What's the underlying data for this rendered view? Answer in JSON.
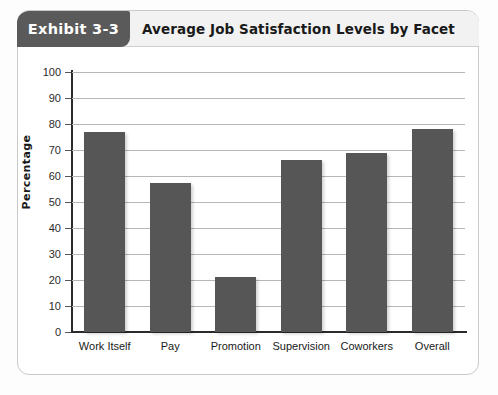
{
  "header": {
    "exhibit_label": "Exhibit 3-3",
    "title": "Average Job Satisfaction Levels by Facet"
  },
  "colors": {
    "bar_fill": "#565656",
    "tab_background": "#5a5a5a",
    "header_band": "#f2f2f2",
    "gridline": "#b7b7b7",
    "axis": "#2b2b2b",
    "panel_border": "#c9c9c9"
  },
  "chart_data": {
    "type": "bar",
    "title": "Average Job Satisfaction Levels by Facet",
    "xlabel": "",
    "ylabel": "Percentage",
    "ylim": [
      0,
      100
    ],
    "ytick_step": 10,
    "yticks": [
      100,
      90,
      80,
      70,
      60,
      50,
      40,
      30,
      20,
      10,
      0
    ],
    "ytick_labels": [
      "100",
      "90",
      "80",
      "70",
      "60",
      "50",
      "40",
      "30",
      "20",
      "10",
      "0"
    ],
    "grid": true,
    "legend": false,
    "categories": [
      "Work Itself",
      "Pay",
      "Promotion",
      "Supervision",
      "Coworkers",
      "Overall"
    ],
    "values": [
      77,
      57.5,
      21,
      66,
      69,
      78
    ]
  }
}
